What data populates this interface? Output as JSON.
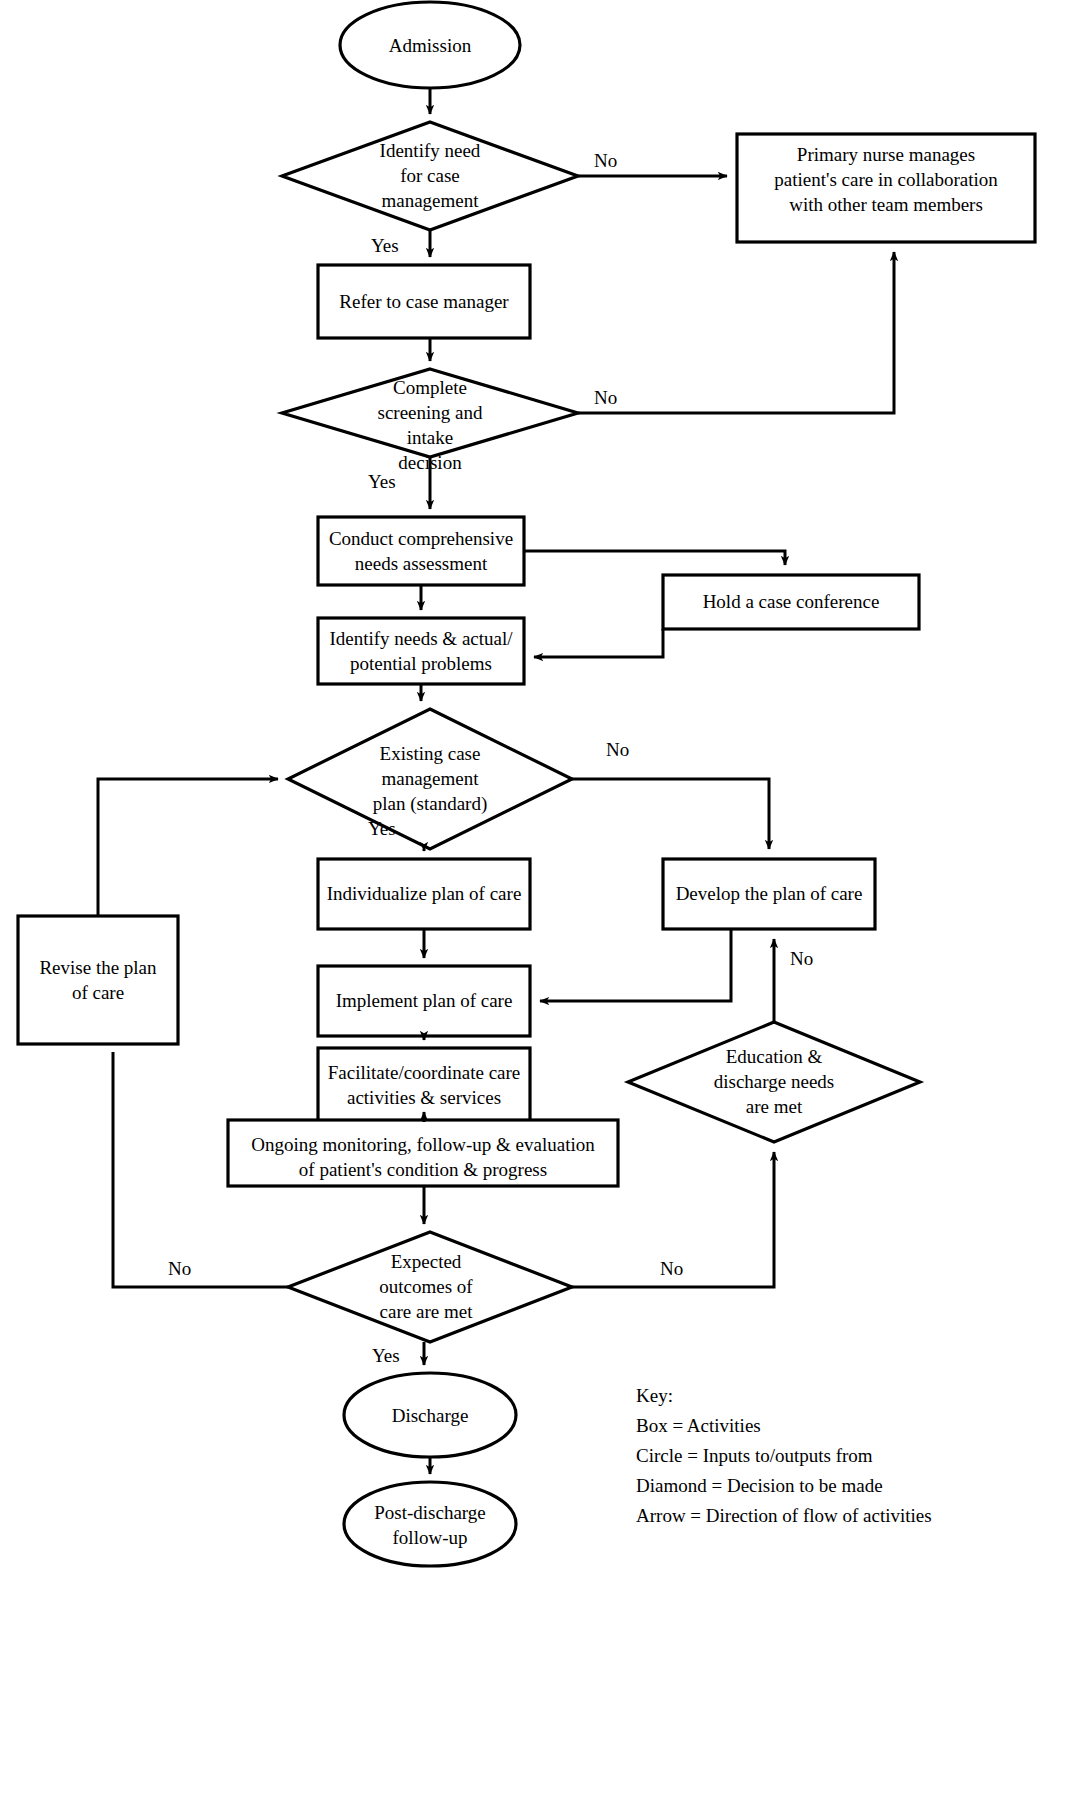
{
  "diagram": {
    "nodes": [
      {
        "id": "admission",
        "type": "circle",
        "label": "Admission"
      },
      {
        "id": "identify-need",
        "type": "diamond",
        "label": "Identify need\nfor case\nmanagement"
      },
      {
        "id": "primary-nurse",
        "type": "box",
        "label": "Primary nurse manages\npatient's care in collaboration\nwith other team members"
      },
      {
        "id": "refer",
        "type": "box",
        "label": "Refer to case manager"
      },
      {
        "id": "screening",
        "type": "diamond",
        "label": "Complete\nscreening and\nintake\ndecision"
      },
      {
        "id": "assessment",
        "type": "box",
        "label": "Conduct comprehensive\nneeds assessment"
      },
      {
        "id": "case-conference",
        "type": "box",
        "label": "Hold a case conference"
      },
      {
        "id": "identify-needs",
        "type": "box",
        "label": "Identify needs & actual/\npotential problems"
      },
      {
        "id": "existing-plan",
        "type": "diamond",
        "label": "Existing case\nmanagement\nplan (standard)"
      },
      {
        "id": "revise-plan",
        "type": "box",
        "label": "Revise the plan\nof care"
      },
      {
        "id": "individualize",
        "type": "box",
        "label": "Individualize plan of care"
      },
      {
        "id": "develop-plan",
        "type": "box",
        "label": "Develop the plan of care"
      },
      {
        "id": "implement",
        "type": "box",
        "label": "Implement plan of care"
      },
      {
        "id": "facilitate",
        "type": "box",
        "label": "Facilitate/coordinate care\nactivities & services"
      },
      {
        "id": "education",
        "type": "diamond",
        "label": "Education &\ndischarge needs\nare met"
      },
      {
        "id": "monitoring",
        "type": "box",
        "label": "Ongoing monitoring, follow-up & evaluation\nof patient's condition & progress"
      },
      {
        "id": "outcomes",
        "type": "diamond",
        "label": "Expected\noutcomes of\ncare are met"
      },
      {
        "id": "discharge",
        "type": "circle",
        "label": "Discharge"
      },
      {
        "id": "post-discharge",
        "type": "circle",
        "label": "Post-discharge\nfollow-up"
      }
    ],
    "edge_labels": [
      {
        "id": "identify-need-no",
        "text": "No"
      },
      {
        "id": "identify-need-yes",
        "text": "Yes"
      },
      {
        "id": "screening-no",
        "text": "No"
      },
      {
        "id": "screening-yes",
        "text": "Yes"
      },
      {
        "id": "existing-plan-no",
        "text": "No"
      },
      {
        "id": "existing-plan-yes",
        "text": "Yes"
      },
      {
        "id": "education-no",
        "text": "No"
      },
      {
        "id": "outcomes-no-left",
        "text": "No"
      },
      {
        "id": "outcomes-no-right",
        "text": "No"
      },
      {
        "id": "outcomes-yes",
        "text": "Yes"
      }
    ],
    "key": {
      "heading": "Key:",
      "lines": [
        "Box = Activities",
        "Circle = Inputs to/outputs from",
        "Diamond = Decision to be made",
        "Arrow = Direction of flow of activities"
      ]
    },
    "colors": {
      "stroke": "#000000",
      "fill": "#ffffff",
      "background": "#ffffff"
    }
  }
}
